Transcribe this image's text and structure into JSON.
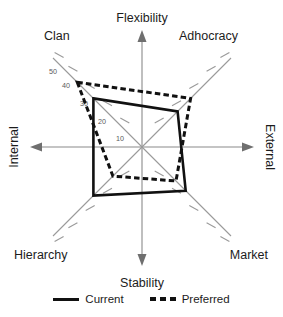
{
  "chart_data": {
    "type": "radar",
    "title": "",
    "subtitle": "",
    "xlabel": "",
    "ylabel": "",
    "grid": false,
    "legend_position": "bottom",
    "categories": [
      "Clan",
      "Adhocracy",
      "Market",
      "Hierarchy"
    ],
    "category_angles_deg": [
      135,
      45,
      315,
      225
    ],
    "radial_ticks": [
      10,
      20,
      30,
      40,
      50
    ],
    "radial_tick_labels": [
      "10",
      "20",
      "30",
      "40",
      "50"
    ],
    "radial_tick_labels_axis": "Clan",
    "rlim": [
      0,
      55
    ],
    "quadrant_axes": [
      {
        "label": "Flexibility",
        "direction": "up"
      },
      {
        "label": "Stability",
        "direction": "down"
      },
      {
        "label": "Internal",
        "direction": "left"
      },
      {
        "label": "External",
        "direction": "right"
      }
    ],
    "series": [
      {
        "name": "Current",
        "style": "solid",
        "color": "#111111",
        "values": [
          30,
          22,
          27,
          30
        ]
      },
      {
        "name": "Preferred",
        "style": "dashed",
        "color": "#111111",
        "values": [
          40,
          30,
          21,
          18
        ]
      }
    ]
  },
  "labels": {
    "flexibility": "Flexibility",
    "stability": "Stability",
    "internal": "Internal",
    "external": "External",
    "clan": "Clan",
    "adhocracy": "Adhocracy",
    "market": "Market",
    "hierarchy": "Hierarchy"
  },
  "ticks": {
    "t50": "50",
    "t40": "40",
    "t30": "30",
    "t20": "20",
    "t10": "10"
  },
  "legend": {
    "current": "Current",
    "preferred": "Preferred"
  },
  "colors": {
    "series": "#111111",
    "axis": "#8a8a8a",
    "diagonal": "#9a9a9a",
    "text": "#1c1c1c",
    "tick_text": "#5a5a5a",
    "background": "#ffffff"
  }
}
